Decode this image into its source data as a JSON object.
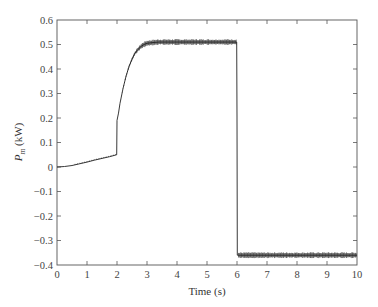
{
  "chart_data": {
    "type": "line",
    "title": "",
    "xlabel": "Time (s)",
    "ylabel": "P_m (kW)",
    "ylabel_parts": {
      "symbol": "P",
      "subscript": "m",
      "unit": " (kW)"
    },
    "xlim": [
      0,
      10
    ],
    "ylim": [
      -0.4,
      0.6
    ],
    "xticks": [
      0,
      1,
      2,
      3,
      4,
      5,
      6,
      7,
      8,
      9,
      10
    ],
    "yticks": [
      0.6,
      0.5,
      0.4,
      0.3,
      0.2,
      0.1,
      0,
      -0.1,
      -0.2,
      -0.3,
      -0.4
    ],
    "ytick_labels": [
      "0.6",
      "0.5",
      "0.4",
      "0.3",
      "0.2",
      "0.1",
      "0",
      "−0.1",
      "−0.2",
      "−0.3",
      "−0.4"
    ],
    "grid": false,
    "legend": null,
    "line_color": "#222222",
    "series": [
      {
        "name": "P_m",
        "x": [
          0,
          0.25,
          0.5,
          0.75,
          1.0,
          1.25,
          1.5,
          1.75,
          1.99,
          2.0,
          2.05,
          2.1,
          2.2,
          2.3,
          2.4,
          2.5,
          2.6,
          2.7,
          2.8,
          2.9,
          3.0,
          3.2,
          3.4,
          3.7,
          4.0,
          4.5,
          5.0,
          5.5,
          5.99,
          6.0,
          6.01,
          6.5,
          7.0,
          7.5,
          8.0,
          8.5,
          9.0,
          9.5,
          10.0
        ],
        "y": [
          0.0,
          0.002,
          0.006,
          0.013,
          0.02,
          0.028,
          0.035,
          0.042,
          0.05,
          0.19,
          0.22,
          0.26,
          0.32,
          0.37,
          0.41,
          0.44,
          0.465,
          0.48,
          0.492,
          0.5,
          0.505,
          0.508,
          0.51,
          0.51,
          0.51,
          0.51,
          0.51,
          0.51,
          0.51,
          0.2,
          -0.36,
          -0.36,
          -0.36,
          -0.36,
          -0.36,
          -0.36,
          -0.36,
          -0.36,
          -0.36
        ],
        "ripple_amplitude_after_2_5s": 0.012
      }
    ]
  }
}
